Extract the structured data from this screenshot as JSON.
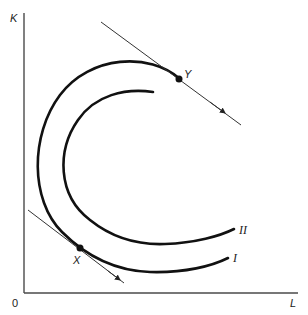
{
  "diagram": {
    "type": "isoquant-diagram",
    "axes": {
      "y_label": "K",
      "x_label": "L",
      "origin_label": "0"
    },
    "curves": [
      {
        "id": "outer",
        "label": "I",
        "passes_through": [
          "Y",
          "X"
        ]
      },
      {
        "id": "inner",
        "label": "II"
      }
    ],
    "points": [
      {
        "id": "Y",
        "label": "Y"
      },
      {
        "id": "X",
        "label": "X"
      }
    ],
    "tangent_lines": [
      {
        "at": "Y",
        "arrow": "down-right"
      },
      {
        "at": "X",
        "arrow": "down-right"
      }
    ],
    "colors": {
      "line": "#111111",
      "axis": "#4a4a4a",
      "background": "#ffffff"
    }
  }
}
